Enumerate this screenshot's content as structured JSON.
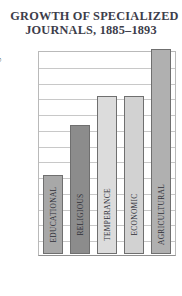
{
  "chart": {
    "title_line1": "GROWTH OF SPECIALIZED",
    "title_line2": "JOURNALS, 1885–1893"
  },
  "chart_data": {
    "type": "bar",
    "title": "GROWTH OF SPECIALIZED JOURNALS, 1885–1893",
    "xlabel": "",
    "ylabel": "Percentage increase",
    "categories": [
      "EDUCATIONAL",
      "RELIGIOUS",
      "TEMPERANCE",
      "ECONOMIC",
      "AGRICULTURAL"
    ],
    "values": [
      50,
      82,
      100,
      100,
      130
    ],
    "bar_colors": [
      "#a8a8a8",
      "#8c8c8c",
      "#dcdcdc",
      "#d2d2d2",
      "#b0b0b0"
    ],
    "ylim": [
      0,
      130
    ],
    "yticks": [
      0,
      10,
      20,
      30,
      40,
      50,
      60,
      70,
      80,
      90,
      100,
      110,
      120,
      130
    ],
    "ytick_labels": [
      "0",
      "10",
      "20",
      "30",
      "40",
      "50",
      "60",
      "70",
      "80",
      "90",
      "100",
      "110",
      "120",
      "130"
    ],
    "grid": true,
    "legend": "none"
  }
}
